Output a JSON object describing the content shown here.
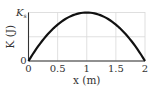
{
  "chart_data": {
    "type": "line",
    "title": "",
    "xlabel": "x (m)",
    "ylabel": "K (J)",
    "xlim": [
      0,
      2
    ],
    "ylim": [
      0,
      1
    ],
    "x_ticks": [
      "0",
      "0.5",
      "1",
      "1.5",
      "2"
    ],
    "x_tick_values": [
      0,
      0.5,
      1,
      1.5,
      2
    ],
    "y_ticks": [
      "0",
      "K_s"
    ],
    "y_tick_values": [
      0,
      1
    ],
    "y_top_label": "K",
    "y_top_label_sub": "s",
    "grid": true,
    "series": [
      {
        "name": "K(x)",
        "description": "parabola, zero at x=0 and x=2, maximum K_s at x=1",
        "x": [
          0,
          0.25,
          0.5,
          0.75,
          1,
          1.25,
          1.5,
          1.75,
          2
        ],
        "values": [
          0,
          0.4375,
          0.75,
          0.9375,
          1,
          0.9375,
          0.75,
          0.4375,
          0
        ]
      }
    ]
  }
}
